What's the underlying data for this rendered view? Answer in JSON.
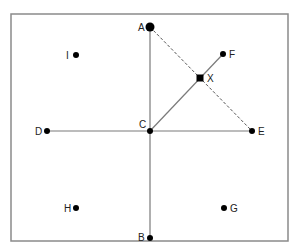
{
  "diagram": {
    "frame": {
      "x": 11,
      "y": 14,
      "width": 277,
      "height": 227,
      "stroke": "#8a8a8a"
    },
    "colors": {
      "line": "#7a7a7a",
      "point": "#000000",
      "dashed": "#555555"
    },
    "points": [
      {
        "id": "A",
        "label": "A",
        "x": 150,
        "y": 27,
        "r": 4.5,
        "lx": 138,
        "ly": 31,
        "shape": "circle"
      },
      {
        "id": "B",
        "label": "B",
        "x": 150,
        "y": 238,
        "r": 3,
        "lx": 138,
        "ly": 241,
        "shape": "circle"
      },
      {
        "id": "C",
        "label": "C",
        "x": 150,
        "y": 131,
        "r": 3,
        "lx": 139,
        "ly": 128,
        "shape": "circle"
      },
      {
        "id": "D",
        "label": "D",
        "x": 47,
        "y": 131,
        "r": 3,
        "lx": 35,
        "ly": 135,
        "shape": "circle"
      },
      {
        "id": "E",
        "label": "E",
        "x": 252,
        "y": 131,
        "r": 3,
        "lx": 258,
        "ly": 135,
        "shape": "circle"
      },
      {
        "id": "F",
        "label": "F",
        "x": 223,
        "y": 54,
        "r": 3,
        "lx": 229,
        "ly": 58,
        "shape": "circle"
      },
      {
        "id": "X",
        "label": "X",
        "x": 200,
        "y": 78,
        "r": 3.5,
        "lx": 207,
        "ly": 82,
        "shape": "square"
      },
      {
        "id": "I",
        "label": "I",
        "x": 76,
        "y": 55,
        "r": 3,
        "lx": 66,
        "ly": 59,
        "shape": "circle"
      },
      {
        "id": "H",
        "label": "H",
        "x": 76,
        "y": 208,
        "r": 3,
        "lx": 64,
        "ly": 212,
        "shape": "circle"
      },
      {
        "id": "G",
        "label": "G",
        "x": 224,
        "y": 208,
        "r": 3,
        "lx": 230,
        "ly": 212,
        "shape": "circle"
      }
    ],
    "segments": [
      {
        "from": "A",
        "to": "B",
        "style": "solid"
      },
      {
        "from": "D",
        "to": "E",
        "style": "solid"
      },
      {
        "from": "C",
        "to": "F",
        "style": "solid"
      },
      {
        "from": "A",
        "to": "E",
        "style": "dashed"
      }
    ]
  }
}
